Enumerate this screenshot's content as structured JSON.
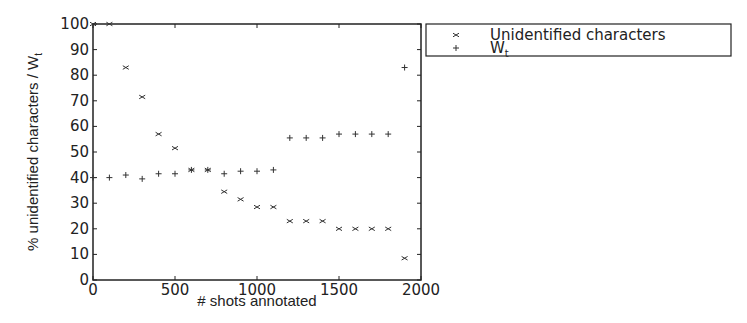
{
  "chart_data": {
    "type": "scatter",
    "title": "",
    "xlabel": "# shots annotated",
    "ylabel": "% unidentified characters / W",
    "ylabel_subscript": "t",
    "xlim": [
      0,
      2000
    ],
    "ylim": [
      0,
      100
    ],
    "xticks": [
      0,
      500,
      1000,
      1500,
      2000
    ],
    "xtick_labels": [
      "0",
      "500",
      "1000",
      "1500",
      "2000"
    ],
    "yticks": [
      0,
      10,
      20,
      30,
      40,
      50,
      60,
      70,
      80,
      90,
      100
    ],
    "ytick_labels": [
      "0",
      "10",
      "20",
      "30",
      "40",
      "50",
      "60",
      "70",
      "80",
      "90",
      "100"
    ],
    "grid": false,
    "legend_position": "outside-top-right",
    "series": [
      {
        "name": "Unidentified characters",
        "marker": "x",
        "points": [
          [
            0,
            100
          ],
          [
            100,
            100
          ],
          [
            200,
            83
          ],
          [
            300,
            71.5
          ],
          [
            400,
            57
          ],
          [
            500,
            51.5
          ],
          [
            600,
            43
          ],
          [
            700,
            43
          ],
          [
            800,
            34.5
          ],
          [
            900,
            31.5
          ],
          [
            1000,
            28.5
          ],
          [
            1100,
            28.5
          ],
          [
            1200,
            23
          ],
          [
            1300,
            23
          ],
          [
            1400,
            23
          ],
          [
            1500,
            20
          ],
          [
            1600,
            20
          ],
          [
            1700,
            20
          ],
          [
            1800,
            20
          ],
          [
            1900,
            8.5
          ]
        ]
      },
      {
        "name": "W",
        "name_subscript": "t",
        "marker": "+",
        "points": [
          [
            0,
            40
          ],
          [
            100,
            40
          ],
          [
            200,
            41
          ],
          [
            300,
            39.5
          ],
          [
            400,
            41.5
          ],
          [
            500,
            41.5
          ],
          [
            600,
            43
          ],
          [
            700,
            43
          ],
          [
            800,
            41.5
          ],
          [
            900,
            42.5
          ],
          [
            1000,
            42.5
          ],
          [
            1100,
            43
          ],
          [
            1200,
            55.5
          ],
          [
            1300,
            55.5
          ],
          [
            1400,
            55.5
          ],
          [
            1500,
            57
          ],
          [
            1600,
            57
          ],
          [
            1700,
            57
          ],
          [
            1800,
            57
          ],
          [
            1900,
            83
          ]
        ]
      }
    ],
    "colors": {
      "axis": "#222222",
      "marker": "#333333",
      "background": "#ffffff"
    }
  }
}
